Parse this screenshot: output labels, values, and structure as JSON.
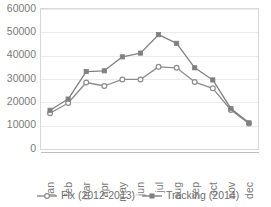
{
  "chart_data": {
    "type": "line",
    "title": "",
    "subtitle": "",
    "xlabel": "",
    "ylabel": "",
    "categories": [
      "jan",
      "feb",
      "mar",
      "apr",
      "may",
      "jun",
      "jul",
      "aug",
      "sep",
      "oct",
      "nov",
      "dec"
    ],
    "ylim": [
      0,
      60000
    ],
    "yticks": [
      0,
      10000,
      20000,
      30000,
      40000,
      50000,
      60000
    ],
    "ytick_labels": [
      "0",
      "10000",
      "20000",
      "30000",
      "40000",
      "50000",
      "60000"
    ],
    "grid": true,
    "grid_axis": "y",
    "legend_position": "bottom",
    "series": [
      {
        "name": "Fix (2012-2013)",
        "color": "#8c8c8c",
        "marker": "open-circle",
        "values": [
          15300,
          19700,
          28500,
          27000,
          29800,
          29800,
          35200,
          34800,
          28700,
          26000,
          16700,
          10900
        ]
      },
      {
        "name": "Tracking (2014)",
        "color": "#808080",
        "marker": "filled-square",
        "values": [
          16600,
          21400,
          33200,
          33500,
          39500,
          41100,
          49000,
          45300,
          34800,
          29600,
          17300,
          11200
        ]
      }
    ]
  },
  "axes": {
    "y_axis_name": "value-axis",
    "x_axis_name": "month-axis"
  },
  "legend": {
    "items": [
      {
        "label": "Fix (2012-2013)",
        "marker": "open-circle"
      },
      {
        "label": "Tracking (2014)",
        "marker": "filled-square"
      }
    ]
  },
  "colors": {
    "series_fix": "#8c8c8c",
    "series_tracking": "#808080",
    "gridline": "#eceaea",
    "text": "#7a7a7a",
    "plot_border": "#d9d7d7"
  }
}
